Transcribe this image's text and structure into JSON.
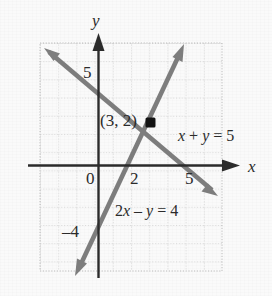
{
  "figure": {
    "type": "coordinate-plane"
  },
  "axes": {
    "x_axis_name": "x",
    "y_axis_name": "y",
    "origin_label": "0",
    "x_tick_labels": [
      "2",
      "5"
    ],
    "y_tick_labels": [
      "5",
      "–4"
    ]
  },
  "labels": {
    "solution_point": "(3, 2)",
    "line1_equation_prefix": "x",
    "line1_equation": "x + y = 5",
    "line2_equation": "2x – y = 4"
  },
  "colors": {
    "line_color": "#787878",
    "axis_color": "#2b2b2b",
    "grid_color": "#b9b9b9",
    "text_color": "#2b2b2b",
    "point_color": "#1a1a1a",
    "background": "#fafafa"
  },
  "chart_data": {
    "type": "line",
    "title": "",
    "xlabel": "x",
    "ylabel": "y",
    "grid": true,
    "legend": "none",
    "xlim": [
      -3,
      7
    ],
    "ylim": [
      -6,
      6
    ],
    "xticks": [
      0,
      2,
      5
    ],
    "yticks": [
      5,
      -4
    ],
    "series": [
      {
        "name": "x + y = 5",
        "equation": "x + y = 5",
        "slope": -1,
        "intercept": 5,
        "points": [
          [
            -3,
            8
          ],
          [
            0,
            5
          ],
          [
            2,
            3
          ],
          [
            3,
            2
          ],
          [
            5,
            0
          ],
          [
            7,
            -2
          ]
        ],
        "arrows": "both"
      },
      {
        "name": "2x - y = 4",
        "equation": "2x – y = 4",
        "slope": 2,
        "intercept": -4,
        "points": [
          [
            -1,
            -6
          ],
          [
            0,
            -4
          ],
          [
            2,
            0
          ],
          [
            3,
            2
          ],
          [
            4.5,
            5
          ]
        ],
        "arrows": "both"
      }
    ],
    "annotations": [
      {
        "text": "(3, 2)",
        "x": 3,
        "y": 2,
        "kind": "solution-point"
      },
      {
        "text": "x + y = 5",
        "x": 6.2,
        "y": 2.4,
        "kind": "line-label"
      },
      {
        "text": "2x – y = 4",
        "x": 2.0,
        "y": -2.6,
        "kind": "line-label"
      }
    ]
  }
}
